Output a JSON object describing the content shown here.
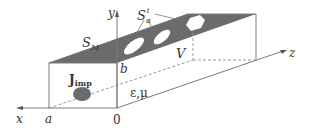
{
  "diagram": {
    "labels": {
      "x_axis": "x",
      "y_axis": "y",
      "z_axis": "z",
      "a": "a",
      "b": "b",
      "origin": "0",
      "surface_m": "S",
      "surface_m_sub": "M",
      "surface_a": "S",
      "surface_a_sub": "a",
      "surface_a_sup": "i",
      "volume": "V",
      "source": "J",
      "source_sub": "imp",
      "medium": "ε,μ"
    },
    "colors": {
      "line": "#7a7a7a",
      "dashed": "#9a9a9a",
      "fill_dark": "#6b6b6b",
      "text": "#333333"
    }
  }
}
